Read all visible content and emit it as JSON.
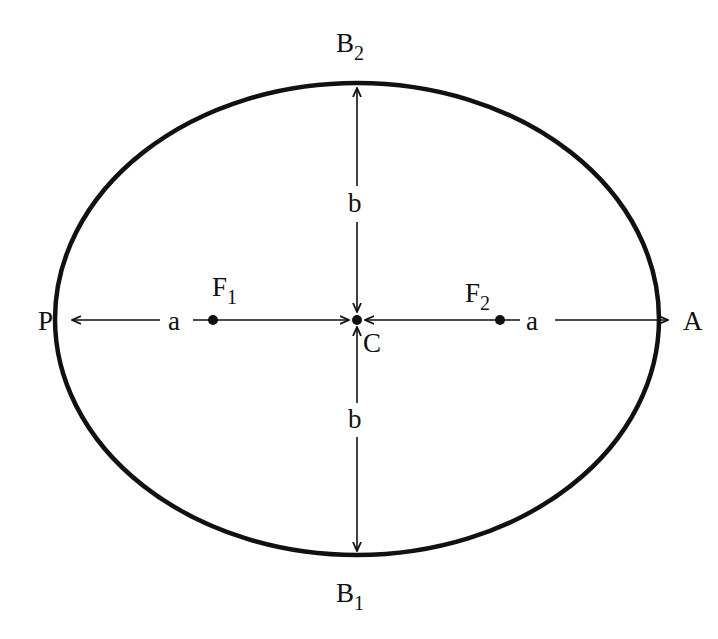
{
  "diagram": {
    "colors": {
      "stroke": "#111111",
      "background": "#ffffff"
    },
    "ellipse": {
      "cx": 357,
      "cy": 319,
      "rx": 302,
      "ry": 236,
      "stroke_width": 4.5
    },
    "points": {
      "P": {
        "label": "P",
        "desc": "periapsis (left vertex)"
      },
      "A": {
        "label": "A",
        "desc": "apoapsis (right vertex)"
      },
      "C": {
        "label": "C",
        "desc": "center"
      },
      "F1": {
        "base": "F",
        "sub": "1",
        "desc": "focus 1"
      },
      "F2": {
        "base": "F",
        "sub": "2",
        "desc": "focus 2"
      },
      "B1": {
        "base": "B",
        "sub": "1",
        "desc": "bottom co-vertex"
      },
      "B2": {
        "base": "B",
        "sub": "2",
        "desc": "top co-vertex"
      }
    },
    "segments": {
      "semi_major_left": "a",
      "semi_major_right": "a",
      "semi_minor_top": "b",
      "semi_minor_bottom": "b"
    }
  }
}
